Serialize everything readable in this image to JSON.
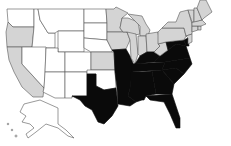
{
  "map": {
    "title": "",
    "region": "United States",
    "legend": [],
    "categories": {
      "none": {
        "color": "#ffffff"
      },
      "union": {
        "color": "#d4d4d4"
      },
      "south": {
        "color": "#0a0a0a"
      }
    },
    "states": [
      {
        "id": "WA",
        "category": "none"
      },
      {
        "id": "OR",
        "category": "union"
      },
      {
        "id": "CA",
        "category": "union"
      },
      {
        "id": "ID",
        "category": "none"
      },
      {
        "id": "NV",
        "category": "none"
      },
      {
        "id": "MT",
        "category": "none"
      },
      {
        "id": "WY",
        "category": "none"
      },
      {
        "id": "UT",
        "category": "none"
      },
      {
        "id": "AZ",
        "category": "none"
      },
      {
        "id": "CO",
        "category": "none"
      },
      {
        "id": "NM",
        "category": "none"
      },
      {
        "id": "ND",
        "category": "none"
      },
      {
        "id": "SD",
        "category": "none"
      },
      {
        "id": "NE",
        "category": "none"
      },
      {
        "id": "KS",
        "category": "union"
      },
      {
        "id": "OK",
        "category": "none"
      },
      {
        "id": "TX",
        "category": "south"
      },
      {
        "id": "MN",
        "category": "union"
      },
      {
        "id": "IA",
        "category": "union"
      },
      {
        "id": "MO",
        "category": "south"
      },
      {
        "id": "AR",
        "category": "south"
      },
      {
        "id": "LA",
        "category": "south"
      },
      {
        "id": "WI",
        "category": "union"
      },
      {
        "id": "IL",
        "category": "union"
      },
      {
        "id": "MI",
        "category": "union"
      },
      {
        "id": "IN",
        "category": "union"
      },
      {
        "id": "OH",
        "category": "union"
      },
      {
        "id": "KY",
        "category": "south"
      },
      {
        "id": "TN",
        "category": "south"
      },
      {
        "id": "MS",
        "category": "south"
      },
      {
        "id": "AL",
        "category": "south"
      },
      {
        "id": "GA",
        "category": "south"
      },
      {
        "id": "FL",
        "category": "south"
      },
      {
        "id": "SC",
        "category": "south"
      },
      {
        "id": "NC",
        "category": "south"
      },
      {
        "id": "VA",
        "category": "south"
      },
      {
        "id": "WV",
        "category": "union"
      },
      {
        "id": "MD",
        "category": "south"
      },
      {
        "id": "DE",
        "category": "south"
      },
      {
        "id": "PA",
        "category": "union"
      },
      {
        "id": "NY",
        "category": "union"
      },
      {
        "id": "NJ",
        "category": "union"
      },
      {
        "id": "CT",
        "category": "union"
      },
      {
        "id": "RI",
        "category": "union"
      },
      {
        "id": "MA",
        "category": "union"
      },
      {
        "id": "VT",
        "category": "union"
      },
      {
        "id": "NH",
        "category": "union"
      },
      {
        "id": "ME",
        "category": "union"
      },
      {
        "id": "AK",
        "category": "none"
      },
      {
        "id": "HI",
        "category": "none"
      }
    ]
  }
}
